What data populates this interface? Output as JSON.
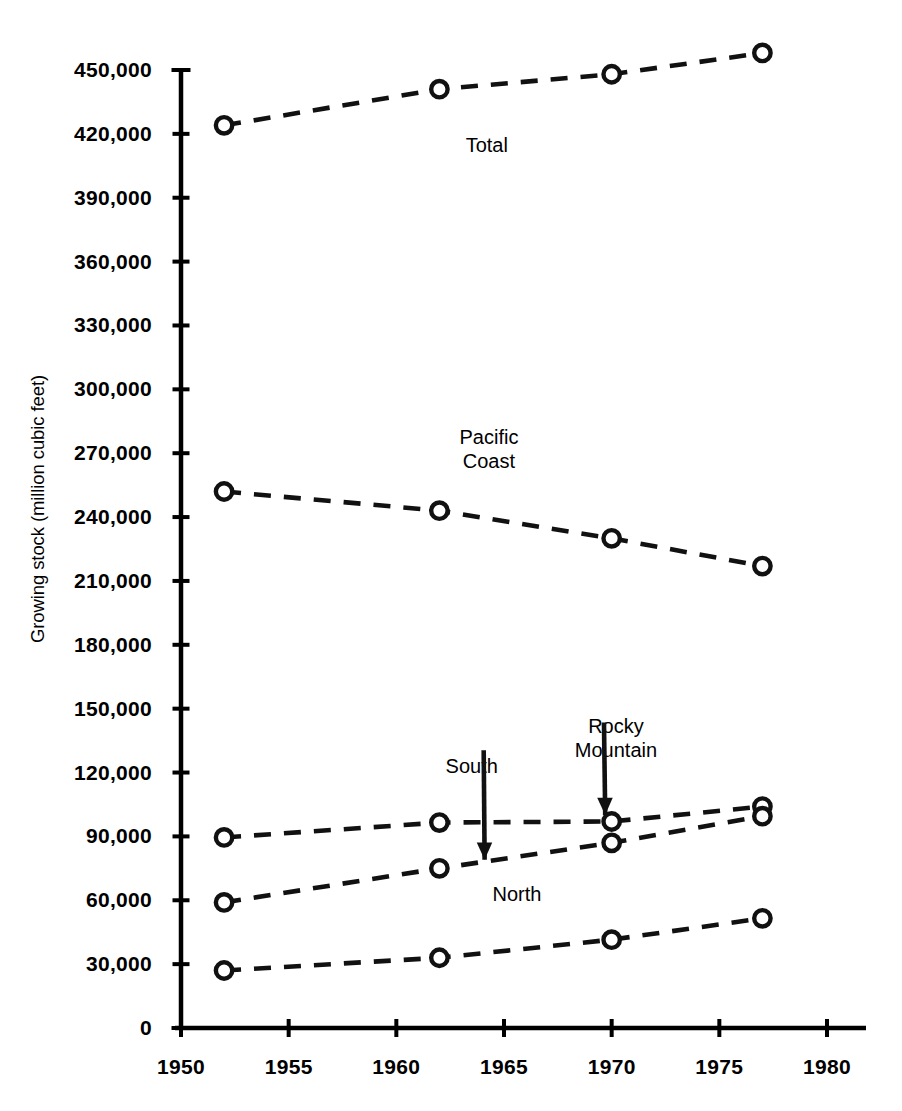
{
  "chart_data": {
    "type": "line",
    "title": "",
    "xlabel": "",
    "ylabel": "Growing stock (million cubic feet)",
    "xlim": [
      1950,
      1980
    ],
    "ylim": [
      0,
      450000
    ],
    "grid": false,
    "legend_position": "inline-annotations",
    "x_ticks": [
      "1950",
      "1955",
      "1960",
      "1965",
      "1970",
      "1975",
      "1980"
    ],
    "x_tick_values": [
      1950,
      1955,
      1960,
      1965,
      1970,
      1975,
      1980
    ],
    "y_ticks": [
      "0",
      "30,000",
      "60,000",
      "90,000",
      "120,000",
      "150,000",
      "180,000",
      "210,000",
      "240,000",
      "270,000",
      "300,000",
      "330,000",
      "360,000",
      "390,000",
      "420,000",
      "450,000"
    ],
    "y_tick_values": [
      0,
      30000,
      60000,
      90000,
      120000,
      150000,
      180000,
      210000,
      240000,
      270000,
      300000,
      330000,
      360000,
      390000,
      420000,
      450000
    ],
    "x": [
      1952,
      1962,
      1970,
      1977
    ],
    "series": [
      {
        "name": "Total",
        "values": [
          424000,
          441000,
          448000,
          458000
        ]
      },
      {
        "name": "Pacific Coast",
        "values": [
          252000,
          243000,
          230000,
          217000
        ]
      },
      {
        "name": "Rocky Mountain",
        "values": [
          89500,
          96500,
          97000,
          104000
        ]
      },
      {
        "name": "South",
        "values": [
          59000,
          75000,
          87000,
          99500
        ]
      },
      {
        "name": "North",
        "values": [
          27000,
          33000,
          41500,
          51500
        ]
      }
    ],
    "annotations": [
      {
        "text": "Total",
        "x": 1964.2,
        "y": 415000,
        "arrow": false
      },
      {
        "text": "Pacific Coast",
        "x": 1964.3,
        "y": 272000,
        "arrow": false,
        "lines": [
          "Pacific",
          "Coast"
        ]
      },
      {
        "text": "South",
        "x": 1963.5,
        "y": 123000,
        "arrow": true,
        "target_x": 1964.1,
        "target_y": 79000
      },
      {
        "text": "Rocky Mountain",
        "x": 1970.2,
        "y": 136000,
        "arrow": true,
        "target_x": 1969.7,
        "target_y": 100000,
        "lines": [
          "Rocky",
          "Mountain"
        ]
      },
      {
        "text": "North",
        "x": 1965.6,
        "y": 63000,
        "arrow": false
      }
    ]
  },
  "style": {
    "line_color": "#111111",
    "marker_fill": "#ffffff",
    "axis_color": "#000000"
  }
}
